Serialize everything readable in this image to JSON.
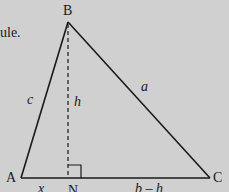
{
  "caption_fragment": "ule.",
  "diagram": {
    "type": "triangle-with-altitude",
    "vertices": {
      "A": {
        "label": "A",
        "x": 21,
        "y": 178
      },
      "B": {
        "label": "B",
        "x": 68,
        "y": 22
      },
      "C": {
        "label": "C",
        "x": 210,
        "y": 178
      },
      "N": {
        "label": "N",
        "x": 68,
        "y": 178
      }
    },
    "side_labels": {
      "c": "c",
      "a": "a",
      "h": "h",
      "x": "x",
      "b_minus_h": "b – h"
    },
    "right_angle_at": "N",
    "colors": {
      "background": "#d0d0d0",
      "stroke": "#1a1a1a"
    }
  }
}
